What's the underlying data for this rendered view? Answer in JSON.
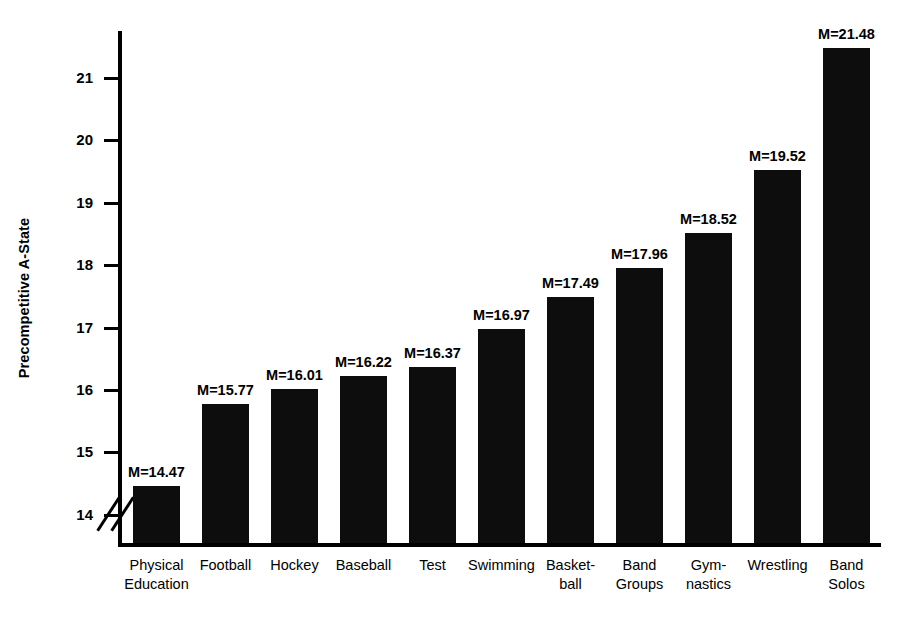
{
  "chart_data": {
    "type": "bar",
    "title": "",
    "xlabel": "",
    "ylabel": "Precompetitive A-State",
    "ylim": [
      13.55,
      21.75
    ],
    "y_axis_broken": true,
    "grid": false,
    "legend": "none",
    "yticks": [
      14,
      15,
      16,
      17,
      18,
      19,
      20,
      21
    ],
    "ytick_labels": [
      "14",
      "15",
      "16",
      "17",
      "18",
      "19",
      "20",
      "21"
    ],
    "categories": [
      "Physical\nEducation",
      "Football",
      "Hockey",
      "Baseball",
      "Test",
      "Swimming",
      "Basket-\nball",
      "Band\nGroups",
      "Gym-\nnastics",
      "Wrestling",
      "Band\nSolos"
    ],
    "values": [
      14.47,
      15.77,
      16.01,
      16.22,
      16.37,
      16.97,
      17.49,
      17.96,
      18.52,
      19.52,
      21.48
    ],
    "data_labels": [
      "M=14.47",
      "M=15.77",
      "M=16.01",
      "M=16.22",
      "M=16.37",
      "M=16.97",
      "M=17.49",
      "M=17.96",
      "M=18.52",
      "M=19.52",
      "M=21.48"
    ],
    "bar_color": "#0d0d0d",
    "background_color": "#ffffff"
  }
}
